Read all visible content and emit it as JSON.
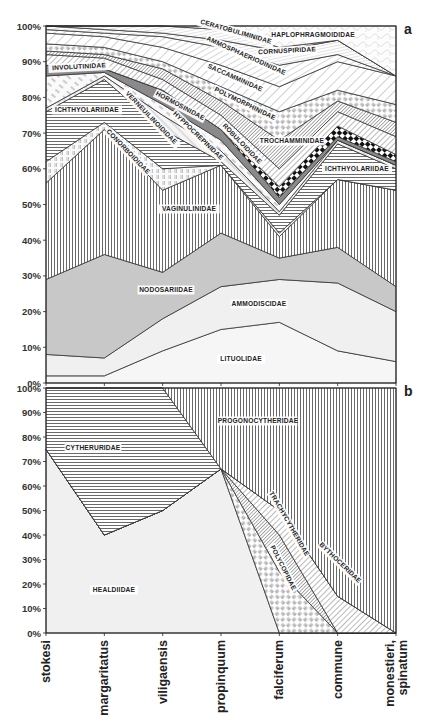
{
  "chart_data": [
    {
      "panel": "a",
      "type": "area",
      "stacked": true,
      "title": "",
      "xlabel": "",
      "ylabel": "",
      "ylim": [
        0,
        100
      ],
      "yticks": [
        "0%",
        "10%",
        "20%",
        "30%",
        "40%",
        "50%",
        "60%",
        "70%",
        "80%",
        "90%",
        "100%"
      ],
      "categories": [
        "stokesi",
        "margaritatus",
        "viligaensis",
        "propinquum",
        "falciferum",
        "commune",
        "monestieri, spinatum"
      ],
      "series_note": "Cumulative upper boundaries (%) of each stacked family band, bottom to top",
      "series": [
        {
          "name": "LITUOLIDAE",
          "top": [
            2,
            2,
            9,
            15,
            17,
            9,
            6
          ],
          "fill": "dots-light"
        },
        {
          "name": "AMMODISCIDAE",
          "top": [
            8,
            7,
            18,
            27,
            29,
            28,
            20
          ],
          "fill": "light-gray"
        },
        {
          "name": "NODOSARIIDAE",
          "top": [
            29,
            36,
            31,
            42,
            35,
            38,
            27
          ],
          "fill": "mid-gray"
        },
        {
          "name": "VAGINULINIDAE",
          "top": [
            56,
            71,
            54,
            61,
            41,
            57,
            54
          ],
          "fill": "vertical-lines"
        },
        {
          "name": "CONORBOIDIDAE",
          "top": [
            62,
            73,
            60,
            61,
            42,
            57,
            54
          ],
          "fill": "light-diag-blocks"
        },
        {
          "name": "ICHTHYOLARIIDAE",
          "top": [
            76,
            85,
            71,
            62,
            47,
            67,
            60
          ],
          "fill": "horizontal-lines"
        },
        {
          "name": "VERNEUILINOIDIDAE",
          "top": [
            77,
            86,
            75,
            65,
            48,
            68,
            61
          ],
          "fill": "light-stipple"
        },
        {
          "name": "HYPPOCREPINIDAE",
          "top": [
            86,
            87,
            78,
            68,
            50,
            68,
            61
          ],
          "fill": "white-gray-dashes"
        },
        {
          "name": "INVOLUTINIDAE",
          "top": [
            89,
            88,
            82,
            71,
            52,
            69,
            62
          ],
          "fill": "dark-gray"
        },
        {
          "name": "ROBULOIDIDAE",
          "top": [
            89,
            88,
            82,
            71,
            55,
            72,
            64
          ],
          "fill": "checkerboard"
        },
        {
          "name": "TROCHAMMINIDAE",
          "top": [
            92,
            91,
            85,
            75,
            60,
            76,
            69
          ],
          "fill": "diagonal-lines"
        },
        {
          "name": "HORMOSINIDAE",
          "top": [
            93,
            92,
            88,
            79,
            68,
            79,
            73
          ],
          "fill": "dense-diagonal"
        },
        {
          "name": "POLYMORPHINIDAE",
          "top": [
            95,
            94,
            90,
            83,
            76,
            82,
            78
          ],
          "fill": "basket-weave"
        },
        {
          "name": "SACCAMMINIDAE",
          "top": [
            98,
            97,
            94,
            89,
            83,
            90,
            86
          ],
          "fill": "wide-diagonal"
        },
        {
          "name": "AMMOSPHAEROIDINIDAE",
          "top": [
            99,
            98,
            97,
            94,
            89,
            92,
            86
          ],
          "fill": "sparse-diagonal"
        },
        {
          "name": "CORNUSPIRIDAE",
          "top": [
            100,
            99,
            98,
            96,
            93,
            96,
            86
          ],
          "fill": "fine-lines"
        },
        {
          "name": "CERATOBULIMINIDAE",
          "top": [
            100,
            100,
            100,
            99,
            94,
            96,
            86
          ],
          "fill": "fine-lines"
        },
        {
          "name": "HAPLOPHRAGMOIDIDAE",
          "top": [
            100,
            100,
            100,
            100,
            100,
            100,
            100
          ],
          "fill": "scale-pattern"
        }
      ],
      "annotations": [
        "a"
      ],
      "grid": false,
      "legend": "none (labels placed inside bands)"
    },
    {
      "panel": "b",
      "type": "area",
      "stacked": true,
      "title": "",
      "xlabel": "",
      "ylabel": "",
      "ylim": [
        0,
        100
      ],
      "yticks": [
        "0%",
        "10%",
        "20%",
        "30%",
        "40%",
        "50%",
        "60%",
        "70%",
        "80%",
        "90%",
        "100%"
      ],
      "categories": [
        "stokesi",
        "margaritatus",
        "viligaensis",
        "propinquum",
        "falciferum",
        "commune",
        "monestieri, spinatum"
      ],
      "series_note": "Cumulative upper boundaries (%) of each stacked family band, bottom to top",
      "series": [
        {
          "name": "HEALDIIDAE",
          "top": [
            75,
            40,
            50,
            67,
            0,
            0,
            0
          ],
          "fill": "light-gray"
        },
        {
          "name": "POLYCOPIDAE",
          "top": [
            75,
            40,
            50,
            67,
            25,
            0,
            0
          ],
          "fill": "basket-weave"
        },
        {
          "name": "TRACHYCYTHERIDAE",
          "top": [
            75,
            40,
            50,
            67,
            40,
            0,
            0
          ],
          "fill": "dense-diagonal"
        },
        {
          "name": "BYTHOCERIDAE",
          "top": [
            75,
            40,
            50,
            67,
            50,
            15,
            0
          ],
          "fill": "diagonal-lines"
        },
        {
          "name": "CYTHERURIDAE",
          "top": [
            100,
            100,
            100,
            67,
            50,
            15,
            0
          ],
          "fill": "horizontal-lines"
        },
        {
          "name": "PROGONOCYTHERIDAE",
          "top": [
            100,
            100,
            100,
            100,
            100,
            100,
            100
          ],
          "fill": "vertical-lines"
        }
      ],
      "annotations": [
        "b"
      ],
      "grid": false,
      "legend": "none (labels placed inside bands)"
    }
  ],
  "labels": {
    "panel_a": "a",
    "panel_b": "b",
    "a_areas": [
      {
        "text": "HAPLOPHRAGMOIDIDAE",
        "x": 313,
        "y": 35,
        "rot": 0
      },
      {
        "text": "CERATOBULIMINIDAE",
        "x": 236,
        "y": 32,
        "rot": 16
      },
      {
        "text": "CORNUSPIRIDAE",
        "x": 287,
        "y": 51,
        "rot": -3
      },
      {
        "text": "AMMOSPHAERIODINIDAE",
        "x": 246,
        "y": 56,
        "rot": 24
      },
      {
        "text": "SACCAMMINIDAE",
        "x": 235,
        "y": 78,
        "rot": 24
      },
      {
        "text": "POLYMORPHINIDAE",
        "x": 245,
        "y": 104,
        "rot": 26
      },
      {
        "text": "INVOLUTINIDAE",
        "x": 79,
        "y": 67,
        "rot": -3
      },
      {
        "text": "HORMOSINIDAE",
        "x": 180,
        "y": 106,
        "rot": 28
      },
      {
        "text": "ICHTHYOLARIIDAE",
        "x": 87,
        "y": 110,
        "rot": 0
      },
      {
        "text": "VERNEUILINOIDIDAE",
        "x": 151,
        "y": 118,
        "rot": 46
      },
      {
        "text": "HYPPOCREPINIDAE",
        "x": 198,
        "y": 136,
        "rot": 44
      },
      {
        "text": "ROBULOIDIDAE",
        "x": 242,
        "y": 144,
        "rot": 46
      },
      {
        "text": "TROCHAMMINIDAE",
        "x": 292,
        "y": 141,
        "rot": 0
      },
      {
        "text": "CONORBOIDIDAE",
        "x": 128,
        "y": 152,
        "rot": 46
      },
      {
        "text": "ICHTHYOLARIIDAE",
        "x": 357,
        "y": 169,
        "rot": 0
      },
      {
        "text": "VAGINULINIDAE",
        "x": 189,
        "y": 209,
        "rot": 0
      },
      {
        "text": "NODOSARIIDAE",
        "x": 166,
        "y": 290,
        "rot": 0
      },
      {
        "text": "AMMODISCIDAE",
        "x": 259,
        "y": 304,
        "rot": 0
      },
      {
        "text": "LITUOLIDAE",
        "x": 241,
        "y": 359,
        "rot": 0
      }
    ],
    "b_areas": [
      {
        "text": "PROGONOCYTHERIDAE",
        "x": 258,
        "y": 421,
        "rot": 0
      },
      {
        "text": "CYTHERURIDAE",
        "x": 93,
        "y": 448,
        "rot": 0
      },
      {
        "text": "HEALDIIDAE",
        "x": 114,
        "y": 590,
        "rot": 0
      },
      {
        "text": "TRACHYCYTHERIDAE",
        "x": 289,
        "y": 524,
        "rot": 60
      },
      {
        "text": "POLYCOPIDAE",
        "x": 283,
        "y": 568,
        "rot": 63
      },
      {
        "text": "BYTHOCERIDAE",
        "x": 340,
        "y": 563,
        "rot": 44
      }
    ]
  },
  "colors": {
    "line": "#333333",
    "text": "#222222",
    "light_gray": "#efefef",
    "mid_gray": "#c8c8c8",
    "dark_gray": "#8a8a8a",
    "white": "#ffffff"
  }
}
